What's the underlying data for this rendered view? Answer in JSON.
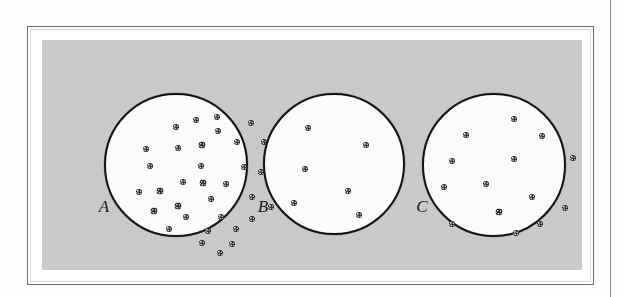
{
  "figure": {
    "caption_labels": [
      "A",
      "B",
      "C"
    ],
    "colors": {
      "page_background": "#fdfdfc",
      "frame_border": "#6f6f6f",
      "frame_inner_border": "#d8d8d6",
      "panel_background": "#c9c9c7",
      "dish_fill": "#fbfbf9",
      "dish_outline": "#141414",
      "colony_dot": "#2a2a2a",
      "label_text": "#1b1b1b",
      "page_rule": "#8d8d8d"
    },
    "layout": {
      "width": 624,
      "height": 297,
      "frame": {
        "x": 27,
        "y": 26,
        "w": 567,
        "h": 259
      },
      "panel": {
        "x": 41,
        "y": 39,
        "w": 540,
        "h": 230
      },
      "page_rule_x": 610
    },
    "dishes": [
      {
        "id": "dish-a",
        "label": "A",
        "colony_count": 35,
        "center": {
          "x": 103,
          "y": 92
        },
        "radius": 72,
        "label_position": {
          "x": 103,
          "y": 197
        },
        "dots": [
          {
            "x": 92,
            "y": 27,
            "d": 6
          },
          {
            "x": 113,
            "y": 24,
            "d": 6
          },
          {
            "x": 72,
            "y": 34,
            "d": 6
          },
          {
            "x": 114,
            "y": 38,
            "d": 6
          },
          {
            "x": 147,
            "y": 30,
            "d": 6
          },
          {
            "x": 42,
            "y": 56,
            "d": 6
          },
          {
            "x": 74,
            "y": 55,
            "d": 6
          },
          {
            "x": 98,
            "y": 52,
            "d": 7
          },
          {
            "x": 133,
            "y": 49,
            "d": 6
          },
          {
            "x": 160,
            "y": 49,
            "d": 6
          },
          {
            "x": 181,
            "y": 63,
            "d": 6
          },
          {
            "x": 46,
            "y": 73,
            "d": 6
          },
          {
            "x": 97,
            "y": 73,
            "d": 6
          },
          {
            "x": 140,
            "y": 74,
            "d": 6
          },
          {
            "x": 157,
            "y": 79,
            "d": 6
          },
          {
            "x": 79,
            "y": 89,
            "d": 6
          },
          {
            "x": 99,
            "y": 90,
            "d": 7
          },
          {
            "x": 122,
            "y": 91,
            "d": 6
          },
          {
            "x": 178,
            "y": 88,
            "d": 6
          },
          {
            "x": 35,
            "y": 99,
            "d": 6
          },
          {
            "x": 56,
            "y": 98,
            "d": 7
          },
          {
            "x": 107,
            "y": 106,
            "d": 6
          },
          {
            "x": 148,
            "y": 104,
            "d": 6
          },
          {
            "x": 74,
            "y": 113,
            "d": 7
          },
          {
            "x": 167,
            "y": 114,
            "d": 6
          },
          {
            "x": 50,
            "y": 118,
            "d": 7
          },
          {
            "x": 82,
            "y": 124,
            "d": 6
          },
          {
            "x": 117,
            "y": 124,
            "d": 6
          },
          {
            "x": 148,
            "y": 126,
            "d": 6
          },
          {
            "x": 65,
            "y": 136,
            "d": 6
          },
          {
            "x": 104,
            "y": 138,
            "d": 6
          },
          {
            "x": 132,
            "y": 136,
            "d": 6
          },
          {
            "x": 98,
            "y": 150,
            "d": 6
          },
          {
            "x": 128,
            "y": 151,
            "d": 6
          },
          {
            "x": 116,
            "y": 160,
            "d": 6
          }
        ]
      },
      {
        "id": "dish-b",
        "label": "B",
        "colony_count": 6,
        "center": {
          "x": 262,
          "y": 92
        },
        "radius": 71,
        "label_position": {
          "x": 262,
          "y": 197
        },
        "dots": [
          {
            "x": 45,
            "y": 35,
            "d": 6
          },
          {
            "x": 103,
            "y": 52,
            "d": 6
          },
          {
            "x": 42,
            "y": 76,
            "d": 6
          },
          {
            "x": 85,
            "y": 98,
            "d": 6
          },
          {
            "x": 31,
            "y": 110,
            "d": 6
          },
          {
            "x": 96,
            "y": 122,
            "d": 6
          }
        ]
      },
      {
        "id": "dish-c",
        "label": "C",
        "colony_count": 14,
        "center": {
          "x": 421,
          "y": 92
        },
        "radius": 72,
        "label_position": {
          "x": 421,
          "y": 197
        },
        "dots": [
          {
            "x": 92,
            "y": 26,
            "d": 6
          },
          {
            "x": 44,
            "y": 42,
            "d": 6
          },
          {
            "x": 120,
            "y": 43,
            "d": 6
          },
          {
            "x": 30,
            "y": 68,
            "d": 6
          },
          {
            "x": 92,
            "y": 66,
            "d": 6
          },
          {
            "x": 151,
            "y": 65,
            "d": 6
          },
          {
            "x": 22,
            "y": 94,
            "d": 6
          },
          {
            "x": 64,
            "y": 91,
            "d": 6
          },
          {
            "x": 110,
            "y": 104,
            "d": 6
          },
          {
            "x": 143,
            "y": 115,
            "d": 6
          },
          {
            "x": 77,
            "y": 119,
            "d": 7
          },
          {
            "x": 30,
            "y": 131,
            "d": 6
          },
          {
            "x": 94,
            "y": 140,
            "d": 6
          },
          {
            "x": 118,
            "y": 131,
            "d": 6
          }
        ]
      }
    ]
  }
}
